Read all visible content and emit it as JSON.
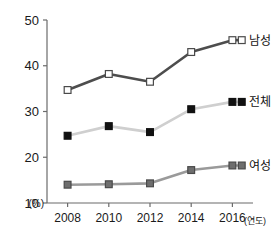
{
  "chart_data": {
    "type": "line",
    "title": "",
    "subtitle": "",
    "xlabel": "(연도)",
    "ylabel": "(%)",
    "x": [
      2008,
      2010,
      2012,
      2014,
      2016
    ],
    "categories": [
      "2008",
      "2010",
      "2012",
      "2014",
      "2016"
    ],
    "xlim": [
      2007,
      2017
    ],
    "ylim": [
      10,
      50
    ],
    "yticks": [
      10,
      20,
      30,
      40,
      50
    ],
    "ytick_labels": [
      "10",
      "20",
      "30",
      "40",
      "50"
    ],
    "xtick_labels": [
      "2008",
      "2010",
      "2012",
      "2014",
      "2016"
    ],
    "grid": false,
    "legend_position": "inline-right",
    "series": [
      {
        "name": "남성",
        "values": [
          34.7,
          38.2,
          36.5,
          43.0,
          45.6
        ],
        "color": "#4d4d4d",
        "marker": "open-square",
        "marker_fill": "#ffffff",
        "label_x": 2016.6,
        "label_y": 45.6
      },
      {
        "name": "전체",
        "values": [
          24.7,
          26.8,
          25.5,
          30.5,
          32.1
        ],
        "color": "#cfcfcf",
        "marker": "filled-square",
        "marker_fill": "#111111",
        "label_x": 2016.6,
        "label_y": 32.1
      },
      {
        "name": "여성",
        "values": [
          14.0,
          14.1,
          14.3,
          17.2,
          18.2
        ],
        "color": "#9a9a9a",
        "marker": "gray-square",
        "marker_fill": "#6e6e6e",
        "label_x": 2016.6,
        "label_y": 18.2
      }
    ]
  },
  "axis": {
    "y_unit": "(%)",
    "x_caption": "(연도)",
    "ticks_y": [
      "50",
      "40",
      "30",
      "20",
      "10"
    ],
    "ticks_x": [
      "2008",
      "2010",
      "2012",
      "2014",
      "2016"
    ]
  },
  "legend": {
    "male": "남성",
    "total": "전체",
    "female": "여성"
  },
  "colors": {
    "male_line": "#4d4d4d",
    "total_line": "#cfcfcf",
    "female_line": "#9a9a9a",
    "axis": "#6b6b6b",
    "text": "#1a1a1a",
    "background": "#ffffff"
  }
}
